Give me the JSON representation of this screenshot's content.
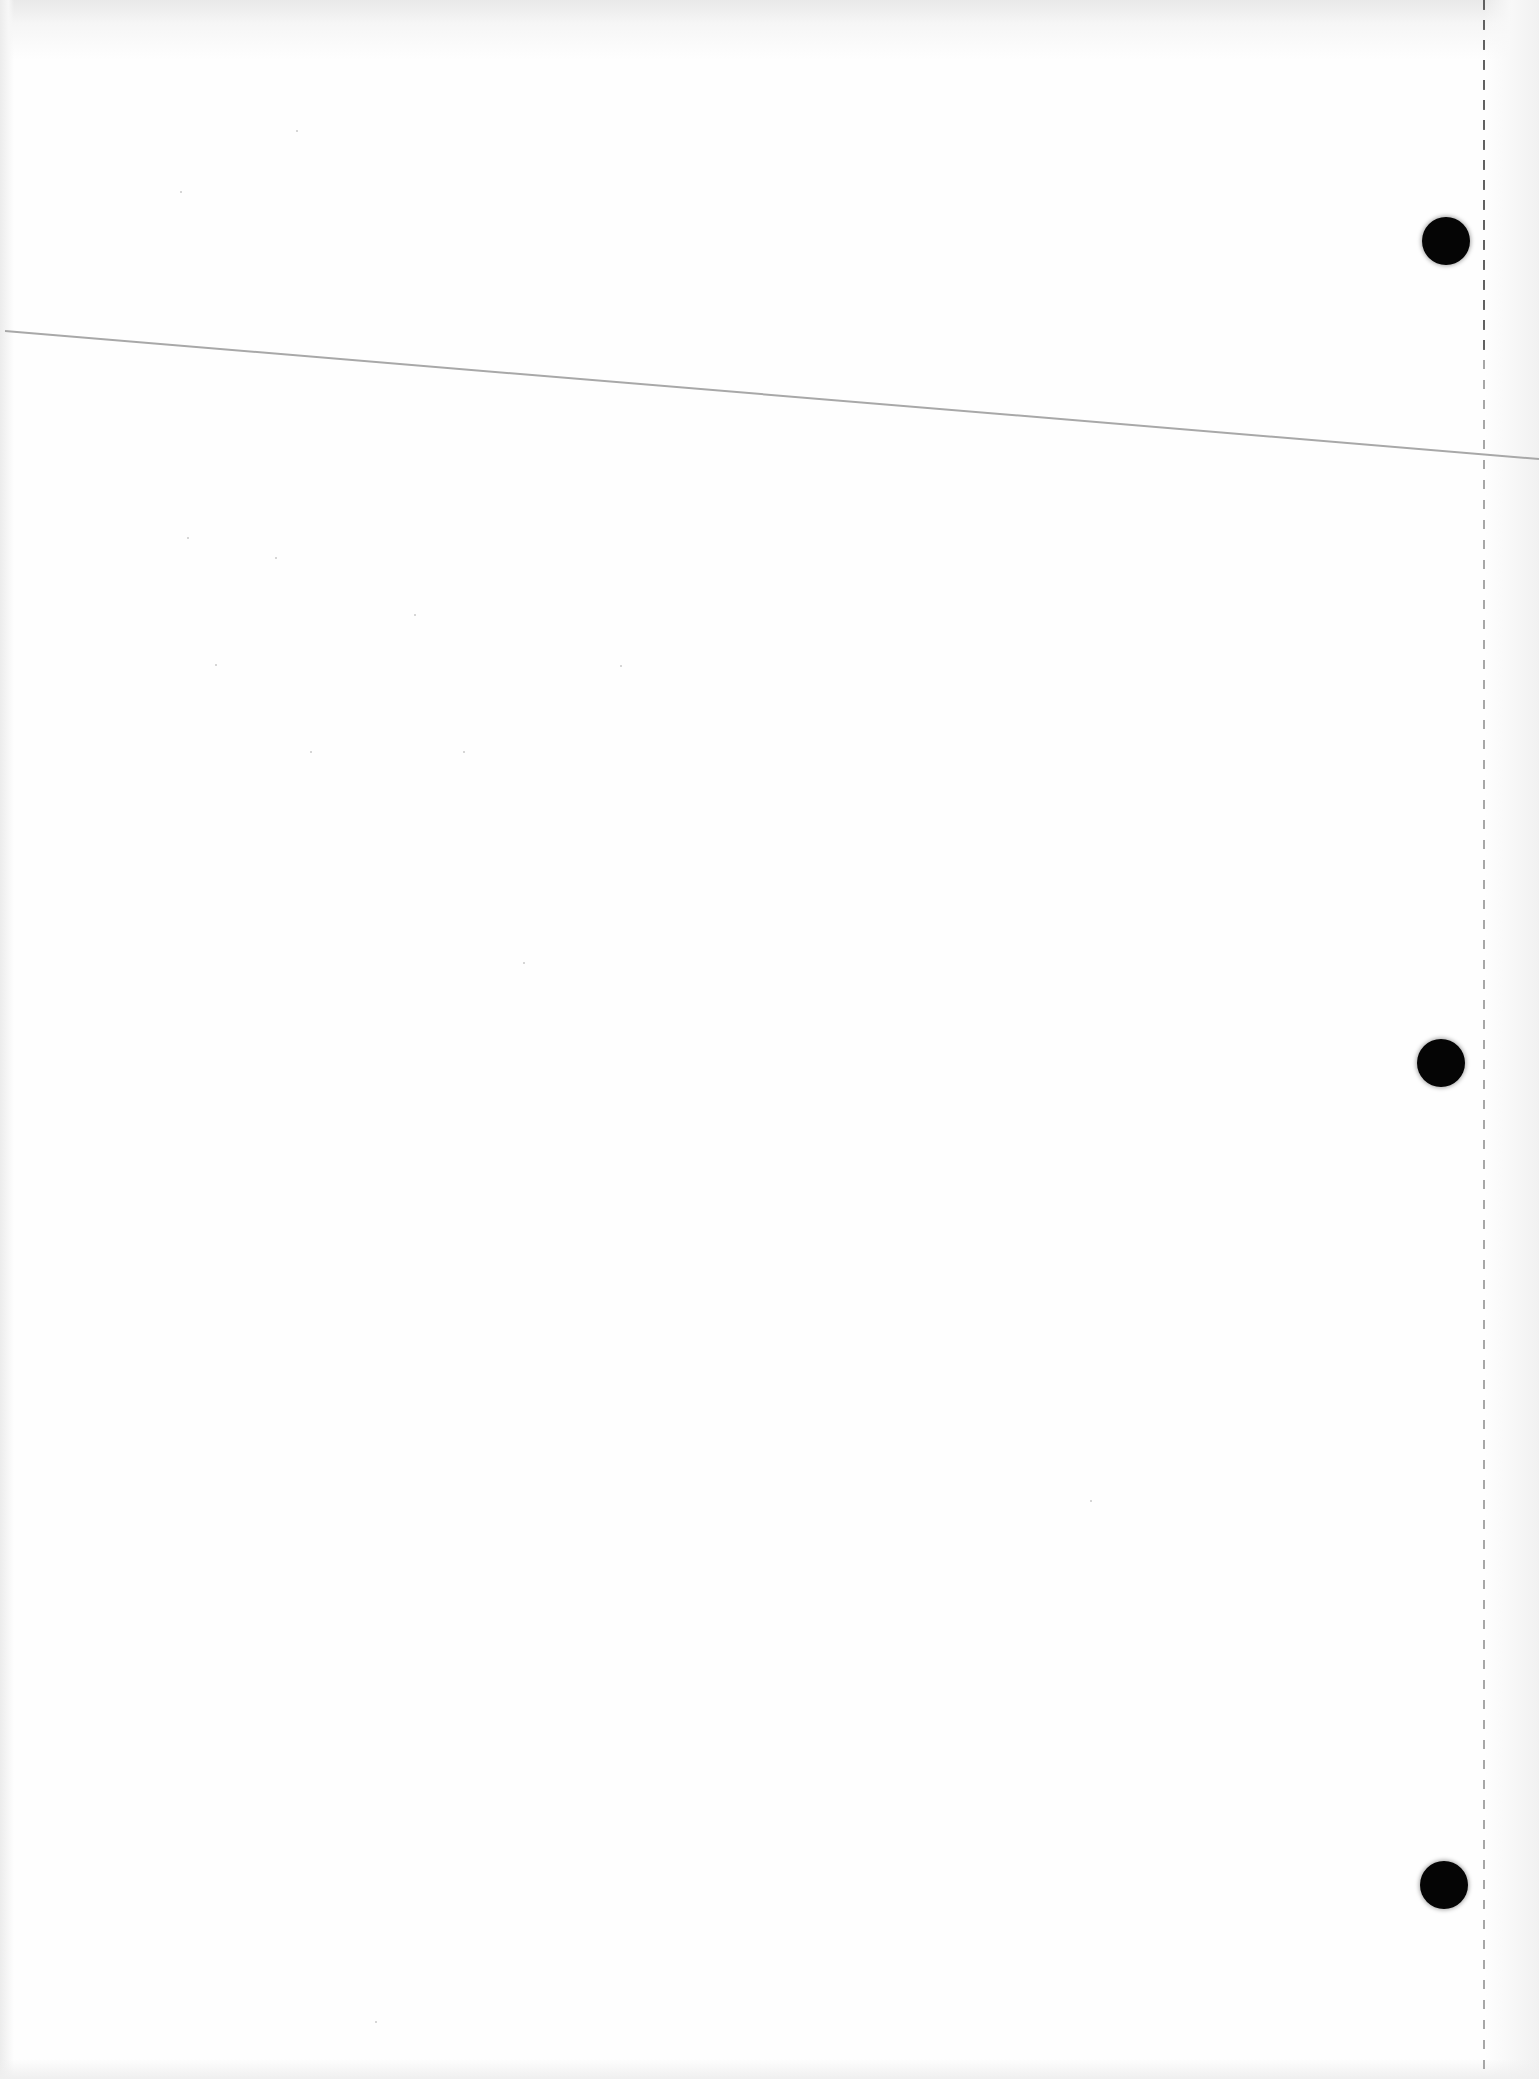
{
  "document": {
    "type": "blank-paper-scan",
    "text": "",
    "punch_holes": [
      {
        "x": 1446,
        "y": 241
      },
      {
        "x": 1441,
        "y": 1063
      },
      {
        "x": 1444,
        "y": 1885
      }
    ],
    "colors": {
      "paper": "#fefefe",
      "hole": "#050505",
      "rule_line": "#a8a8a8",
      "perforation": "#8a8a8a"
    }
  }
}
